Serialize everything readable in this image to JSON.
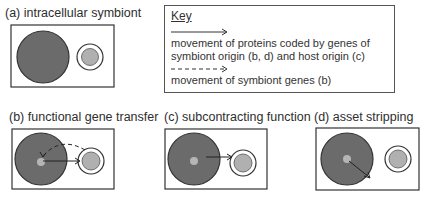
{
  "panels": [
    {
      "id": "a",
      "title": "(a) intracellular symbiont",
      "arrows": []
    },
    {
      "id": "b",
      "title": "(b) functional gene transfer",
      "arrows": [
        "solid: host nucleus to symbiont",
        "dashed: symbiont to host nucleus"
      ]
    },
    {
      "id": "c",
      "title": "(c) subcontracting function",
      "arrows": [
        "solid: host cell to symbiont"
      ]
    },
    {
      "id": "d",
      "title": "(d) asset stripping",
      "arrows": [
        "solid: host nucleus outward"
      ]
    }
  ],
  "key": {
    "title": "Key",
    "solid_arrow_desc_line1": "movement of proteins coded by genes of",
    "solid_arrow_desc_line2": "symbiont origin (b, d) and host origin (c)",
    "dashed_arrow_desc": "movement of symbiont genes (b)"
  },
  "colors": {
    "host_cell": "#6b6b6b",
    "host_nucleus": "#b5b5b5",
    "symbiont_inner": "#b0b0b0",
    "outline": "#333333"
  }
}
